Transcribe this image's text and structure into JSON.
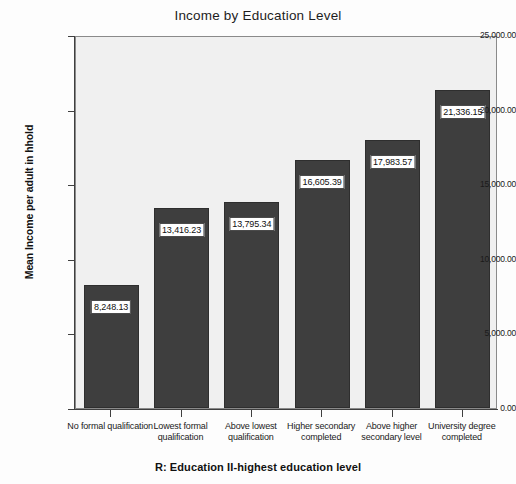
{
  "chart_data": {
    "type": "bar",
    "title": "Income by Education Level",
    "xlabel": "R: Education II-highest education level",
    "ylabel": "Mean Income per adult in hhold",
    "categories": [
      "No formal qualification",
      "Lowest formal qualification",
      "Above lowest qualification",
      "Higher secondary completed",
      "Above higher secondary level",
      "University degree completed"
    ],
    "values": [
      8248.13,
      13416.23,
      13795.34,
      16605.39,
      17983.57,
      21336.15
    ],
    "value_labels": [
      "8,248.13",
      "13,416.23",
      "13,795.34",
      "16,605.39",
      "17,983.57",
      "21,336.15"
    ],
    "ylim": [
      0,
      25000
    ],
    "yticks": [
      0,
      5000,
      10000,
      15000,
      20000,
      25000
    ],
    "ytick_labels": [
      "0.00",
      "5,000.00",
      "10,000.00",
      "15,000.00",
      "20,000.00",
      "25,000.00"
    ],
    "grid": false,
    "legend": "none",
    "bar_color": "#3e3e3e",
    "plot_background": "#f0f0f0",
    "label_background": "#ffffff"
  }
}
